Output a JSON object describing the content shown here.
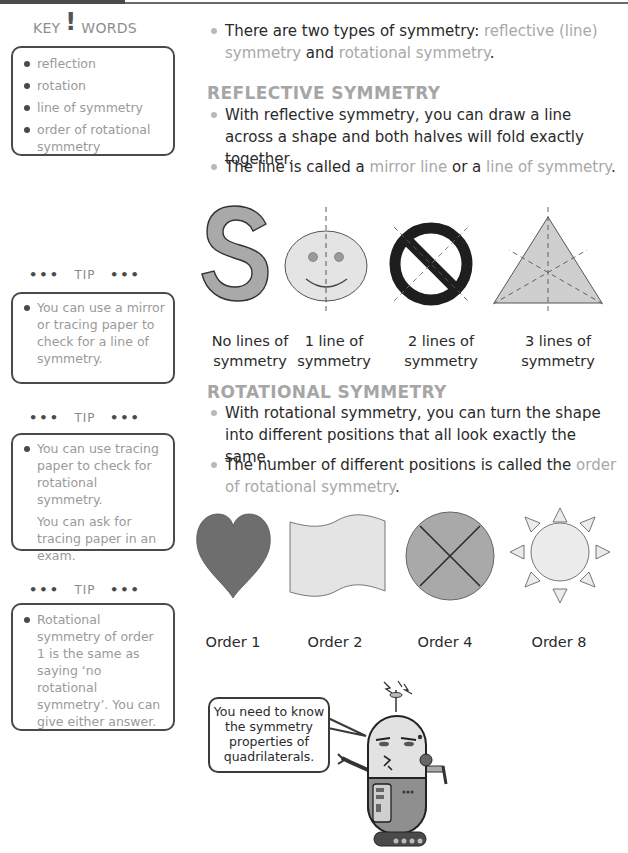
{
  "header": {
    "bar": "top-rule"
  },
  "sidebar": {
    "key_words": {
      "title_left": "KEY",
      "title_bang": "!",
      "title_right": "WORDS",
      "items": [
        "reflection",
        "rotation",
        "line of symmetry",
        "order of rotational symmetry"
      ]
    },
    "tips": [
      {
        "title": "TIP",
        "dots": "•••",
        "text": "You can use a mirror or tracing paper to check for a line of symmetry.",
        "extra": ""
      },
      {
        "title": "TIP",
        "dots": "•••",
        "text": "You can use tracing paper to check for rotational symmetry.",
        "extra": "You can ask for tracing paper in an exam."
      },
      {
        "title": "TIP",
        "dots": "•••",
        "text": "Rotational symmetry of order 1 is the same as saying ‘no rotational symmetry’. You can give either answer.",
        "extra": ""
      }
    ]
  },
  "main": {
    "intro": {
      "pre": "There are two types of symmetry: ",
      "hl1": "reflective (line) symmetry",
      "mid": " and ",
      "hl2": "rotational symmetry",
      "post": "."
    },
    "reflective": {
      "heading": "REFLECTIVE SYMMETRY",
      "p1": "With reflective symmetry, you can draw a line across a shape and both halves will fold exactly together.",
      "p2_pre": "The line is called a ",
      "p2_hl1": "mirror line",
      "p2_mid": " or a ",
      "p2_hl2": "line of symmetry",
      "p2_post": ".",
      "figures": [
        {
          "shape": "letter-S",
          "glyph": "S",
          "caption_1": "No lines of",
          "caption_2": "symmetry"
        },
        {
          "shape": "smiley-face",
          "caption_1": "1 line of",
          "caption_2": "symmetry"
        },
        {
          "shape": "no-entry-sign",
          "caption_1": "2 lines of",
          "caption_2": "symmetry"
        },
        {
          "shape": "equilateral-triangle",
          "caption_1": "3 lines of",
          "caption_2": "symmetry"
        }
      ]
    },
    "rotational": {
      "heading": "ROTATIONAL SYMMETRY",
      "p1": "With rotational symmetry, you can turn the shape into different positions that all look exactly the same.",
      "p2_pre": "The number of different positions is called the ",
      "p2_hl": "order of rotational symmetry",
      "p2_post": ".",
      "figures": [
        {
          "shape": "heart",
          "caption": "Order 1"
        },
        {
          "shape": "wavy-flag",
          "caption": "Order 2"
        },
        {
          "shape": "quartered-circle",
          "caption": "Order 4"
        },
        {
          "shape": "sun",
          "caption": "Order 8"
        }
      ]
    },
    "speech_bubble": {
      "line1": "You need to know",
      "line2": "the symmetry",
      "line3": "properties of",
      "line4": "quadrilaterals."
    }
  },
  "colors": {
    "highlight_text": "#a8a8a8",
    "body_text": "#2a2a2a",
    "box_border": "#4a4a4a",
    "fill_dark": "#6e6e6e",
    "fill_mid": "#a9a9a9",
    "fill_light": "#e4e4e4"
  }
}
